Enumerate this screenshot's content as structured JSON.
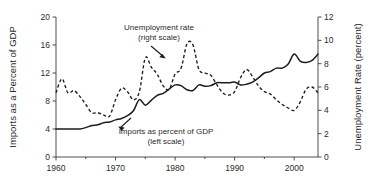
{
  "chart_data": {
    "type": "line",
    "title": "",
    "xlabel": "",
    "ylabel": "Imports as a Percent of GDP",
    "y2label": "Unemployment Rate (percent)",
    "grid": false,
    "legend_position": "inline-annotations",
    "xlim": [
      1960,
      2004
    ],
    "ylim": [
      0,
      20
    ],
    "y2lim": [
      0,
      12
    ],
    "xticks": [
      1960,
      1970,
      1980,
      1990,
      2000
    ],
    "xtick_labels": [
      "1960",
      "1970",
      "1980",
      "1990",
      "2000"
    ],
    "xminor_ticks": [
      1965,
      1975,
      1985,
      1995
    ],
    "yticks": [
      0,
      4,
      8,
      12,
      16,
      20
    ],
    "ytick_labels": [
      "0",
      "4",
      "8",
      "12",
      "16",
      "20"
    ],
    "y2ticks": [
      0,
      2,
      4,
      6,
      8,
      10,
      12
    ],
    "y2tick_labels": [
      "0",
      "2",
      "4",
      "6",
      "8",
      "10",
      "12"
    ],
    "series": [
      {
        "name": "Imports as percent of GDP",
        "axis": "left",
        "style": "solid",
        "x": [
          1960,
          1961,
          1962,
          1963,
          1964,
          1965,
          1966,
          1967,
          1968,
          1969,
          1970,
          1971,
          1972,
          1973,
          1974,
          1975,
          1976,
          1977,
          1978,
          1979,
          1980,
          1981,
          1982,
          1983,
          1984,
          1985,
          1986,
          1987,
          1988,
          1989,
          1990,
          1991,
          1992,
          1993,
          1994,
          1995,
          1996,
          1997,
          1998,
          1999,
          2000,
          2001,
          2002,
          2003,
          2004
        ],
        "values": [
          4.0,
          4.0,
          4.0,
          4.0,
          4.0,
          4.2,
          4.5,
          4.6,
          4.9,
          5.0,
          5.3,
          5.5,
          5.9,
          6.6,
          8.2,
          7.4,
          8.1,
          8.8,
          9.1,
          9.7,
          10.3,
          10.2,
          9.6,
          9.5,
          10.3,
          10.1,
          10.2,
          10.6,
          10.6,
          10.6,
          10.7,
          10.3,
          10.4,
          10.7,
          11.3,
          12.0,
          12.2,
          12.7,
          12.7,
          13.3,
          14.7,
          13.7,
          13.5,
          13.8,
          14.7
        ]
      },
      {
        "name": "Unemployment rate",
        "axis": "right",
        "style": "dashed",
        "x": [
          1960,
          1961,
          1962,
          1963,
          1964,
          1965,
          1966,
          1967,
          1968,
          1969,
          1970,
          1971,
          1972,
          1973,
          1974,
          1975,
          1976,
          1977,
          1978,
          1979,
          1980,
          1981,
          1982,
          1983,
          1984,
          1985,
          1986,
          1987,
          1988,
          1989,
          1990,
          1991,
          1992,
          1993,
          1994,
          1995,
          1996,
          1997,
          1998,
          1999,
          2000,
          2001,
          2002,
          2003,
          2004
        ],
        "values": [
          5.5,
          6.7,
          5.5,
          5.7,
          5.2,
          4.5,
          3.8,
          3.8,
          3.6,
          3.5,
          4.9,
          5.9,
          5.6,
          4.9,
          5.6,
          8.5,
          7.7,
          7.1,
          6.1,
          5.8,
          7.1,
          7.6,
          9.7,
          9.6,
          7.5,
          7.2,
          7.0,
          6.2,
          5.5,
          5.3,
          5.6,
          6.8,
          7.5,
          6.9,
          6.1,
          5.6,
          5.4,
          4.9,
          4.5,
          4.2,
          4.0,
          4.7,
          5.8,
          6.0,
          5.5
        ]
      }
    ],
    "annotations": [
      {
        "name": "unemployment-rate-annotation",
        "line1": "Unemployment rate",
        "line2": "(right scale)"
      },
      {
        "name": "imports-annotation",
        "line1": "Imports as percent of GDP",
        "line2": "(left scale)"
      }
    ],
    "colors": {
      "series_line": "#1c1c1c",
      "axis": "#3a3a3a",
      "text": "#2b2b2b",
      "background": "#ffffff"
    }
  }
}
